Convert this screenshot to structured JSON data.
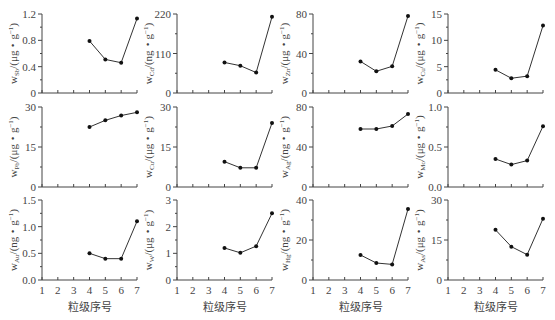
{
  "chart_data": {
    "type": "line",
    "layout": "grid 3x4",
    "xlabel": "粒级序号",
    "x_ticks": [
      1,
      2,
      3,
      4,
      5,
      6,
      7
    ],
    "x": [
      4,
      5,
      6,
      7
    ],
    "panels": [
      {
        "element": "Sb",
        "unit": "μg・g",
        "ylim": [
          0,
          1.2
        ],
        "yticks": [
          "0",
          "0.4",
          "0.8",
          "1.2"
        ],
        "values": [
          0.79,
          0.51,
          0.46,
          1.13
        ]
      },
      {
        "element": "Cd",
        "unit": "ng・g",
        "ylim": [
          0,
          220
        ],
        "yticks": [
          "0",
          "110",
          "220"
        ],
        "values": [
          85,
          76,
          57,
          212
        ]
      },
      {
        "element": "Zn",
        "unit": "μg・g",
        "ylim": [
          0,
          80
        ],
        "yticks": [
          "0",
          "40",
          "80"
        ],
        "values": [
          32,
          22,
          27,
          78
        ]
      },
      {
        "element": "Cu",
        "unit": "μg・g",
        "ylim": [
          0,
          15
        ],
        "yticks": [
          "0",
          "5",
          "10",
          "15"
        ],
        "values": [
          4.4,
          2.8,
          3.2,
          12.8
        ]
      },
      {
        "element": "Pb",
        "unit": "μg・g",
        "ylim": [
          0,
          30
        ],
        "yticks": [
          "0",
          "15",
          "30"
        ],
        "values": [
          22.5,
          25.0,
          26.8,
          28.0
        ]
      },
      {
        "element": "Cu",
        "unit": "μg・g",
        "ylim": [
          0,
          30
        ],
        "yticks": [
          "0",
          "15",
          "30"
        ],
        "values": [
          9.5,
          7.2,
          7.2,
          24.0
        ]
      },
      {
        "element": "Ag",
        "unit": "ng・g",
        "ylim": [
          0,
          80
        ],
        "yticks": [
          "0",
          "40",
          "80"
        ],
        "values": [
          58,
          58,
          61,
          73
        ]
      },
      {
        "element": "Mo",
        "unit": "μg・g",
        "ylim": [
          0,
          1.0
        ],
        "yticks": [
          "0.0",
          "0.5",
          "1.0"
        ],
        "values": [
          0.35,
          0.28,
          0.33,
          0.76
        ]
      },
      {
        "element": "Au",
        "unit": "ng・g",
        "ylim": [
          0,
          1.5
        ],
        "yticks": [
          "0.0",
          "0.5",
          "1.0",
          "1.5"
        ],
        "values": [
          0.5,
          0.4,
          0.4,
          1.1
        ]
      },
      {
        "element": "W",
        "unit": "μg・g",
        "ylim": [
          0,
          3
        ],
        "yticks": [
          "0",
          "1",
          "2",
          "3"
        ],
        "values": [
          1.2,
          1.02,
          1.27,
          2.5
        ]
      },
      {
        "element": "Hg",
        "unit": "ng・g",
        "ylim": [
          0,
          40
        ],
        "yticks": [
          "0",
          "20",
          "40"
        ],
        "values": [
          12.5,
          8.5,
          7.8,
          35.5
        ]
      },
      {
        "element": "As",
        "unit": "μg・g",
        "ylim": [
          0,
          30
        ],
        "yticks": [
          "0",
          "15",
          "30"
        ],
        "values": [
          18.8,
          12.5,
          9.5,
          23.0
        ]
      }
    ]
  }
}
